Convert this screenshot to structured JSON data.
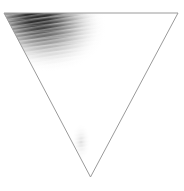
{
  "figure": {
    "title": "Inverted triangle with grayscale gradient smudge",
    "canvas": {
      "width": 184,
      "height": 191,
      "background_color": "#ffffff"
    },
    "shape": {
      "name": "inverted-triangle",
      "type": "triangle",
      "orientation": "point-down",
      "vertices": [
        {
          "label": "top-left",
          "x": 4,
          "y": 13
        },
        {
          "label": "top-right",
          "x": 178,
          "y": 13
        },
        {
          "label": "bottom-apex",
          "x": 90.5,
          "y": 177
        }
      ],
      "stroke_color": "#9a9a9a",
      "stroke_width": 1,
      "fill_color": "#ffffff"
    },
    "smudges": [
      {
        "name": "primary-upper-left-smudge",
        "center_x": 36,
        "center_y": 24,
        "radius_x": 62,
        "radius_y": 46,
        "rotation_deg": 18,
        "darkest_color": "#141414",
        "mid_color": "#8c8c8c",
        "edge_color": "#ffffff",
        "opacity": 1
      },
      {
        "name": "secondary-apex-smudge",
        "center_x": 87,
        "center_y": 132,
        "radius_x": 15,
        "radius_y": 40,
        "rotation_deg": 4,
        "darkest_color": "#9d9d9d",
        "mid_color": "#d8d8d8",
        "edge_color": "#ffffff",
        "opacity": 0.85
      }
    ],
    "texture": {
      "name": "horizontal-streak-banding",
      "band_height": 2,
      "band_color": "#ffffff",
      "band_opacity": 0.3,
      "shear_deg": -9
    }
  },
  "chart_data": {
    "type": "scatter",
    "title": "Inverted triangle with grayscale gradient smudge",
    "xlabel": "",
    "ylabel": "",
    "xlim": [
      0,
      184
    ],
    "ylim": [
      0,
      191
    ],
    "grid": false,
    "legend": "none",
    "series": [
      {
        "name": "triangle-outline",
        "x": [
          4,
          178,
          90.5,
          4
        ],
        "values": [
          13,
          13,
          177,
          13
        ]
      }
    ],
    "annotations": [
      "Dark grayscale gradient concentrated in upper-left interior",
      "Faint vertical streak above the bottom apex",
      "Fine horizontal streak banding across the gradient"
    ]
  }
}
